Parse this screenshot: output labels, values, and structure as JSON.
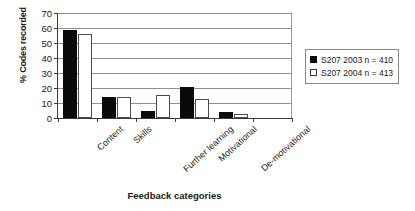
{
  "chart_data": {
    "type": "bar",
    "title": "",
    "xlabel": "Feedback categories",
    "ylabel": "% Codes recorded",
    "categories": [
      "Content",
      "Skills",
      "Further learning",
      "Motivational",
      "De-motivational"
    ],
    "series": [
      {
        "name": "S207 2003 n = 410",
        "color": "#0a0a0a",
        "values": [
          59,
          14,
          5,
          21,
          4
        ]
      },
      {
        "name": "S207 2004 n = 413",
        "color": "#ffffff",
        "values": [
          56,
          14,
          15.5,
          13,
          3
        ]
      }
    ],
    "ylim": [
      0,
      70
    ],
    "ytick_step": 10,
    "yticks": [
      0,
      10,
      20,
      30,
      40,
      50,
      60,
      70
    ],
    "grid": true,
    "grid_axis": "y",
    "legend_position": "right",
    "xtick_slots": 6,
    "empty_trailing_slot": true
  },
  "legend": {
    "entries": [
      {
        "label": "S207 2003 n = 410",
        "swatch": "filled-black-square"
      },
      {
        "label": "S207 2004 n = 413",
        "swatch": "outlined-white-square"
      }
    ]
  },
  "colors": {
    "series_2003": "#0a0a0a",
    "series_2004": "#ffffff",
    "axis": "#3a3a3a",
    "gridline": "#8f8f8f",
    "background": "#ffffff"
  }
}
